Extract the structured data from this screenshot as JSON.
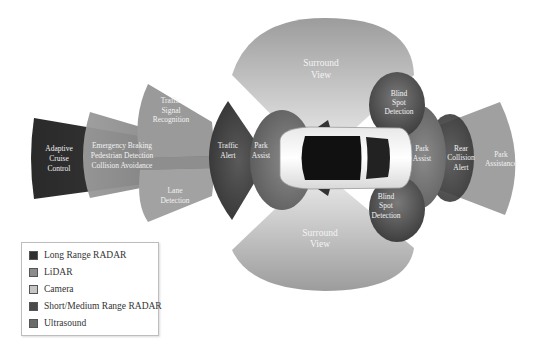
{
  "colors": {
    "long_range_radar": "#2f2f2f",
    "lidar": "#8c8c8c",
    "camera": "#b4b4b4",
    "short_medium_range_radar": "#4d4d4d",
    "ultrasound": "#6e6e6e"
  },
  "zones": {
    "adaptive_cruise_control": {
      "lines": [
        "Adaptive",
        "Cruise",
        "Control"
      ],
      "sensor": "Long Range RADAR"
    },
    "emergency_braking": {
      "lines": [
        "Emergency Braking",
        "Pedestrian Detection",
        "Collision Avoidance"
      ],
      "sensor": "LiDAR"
    },
    "traffic_signal_recognition": {
      "lines": [
        "Traffic",
        "Signal",
        "Recognition"
      ],
      "sensor": "Camera"
    },
    "lane_detection": {
      "lines": [
        "Lane",
        "Detection"
      ],
      "sensor": "Camera"
    },
    "traffic_alert": {
      "lines": [
        "Traffic",
        "Alert"
      ],
      "sensor": "Short/Medium Range RADAR"
    },
    "park_assist_front": {
      "lines": [
        "Park",
        "Assist"
      ],
      "sensor": "Ultrasound"
    },
    "surround_view_top": {
      "lines": [
        "Surround",
        "View"
      ],
      "sensor": "Camera"
    },
    "surround_view_bottom": {
      "lines": [
        "Surround",
        "View"
      ],
      "sensor": "Camera"
    },
    "blind_spot_top": {
      "lines": [
        "Blind",
        "Spot",
        "Detection"
      ],
      "sensor": "Short/Medium Range RADAR"
    },
    "blind_spot_bottom": {
      "lines": [
        "Blind",
        "Spot",
        "Detection"
      ],
      "sensor": "Short/Medium Range RADAR"
    },
    "park_assist_rear": {
      "lines": [
        "Park",
        "Assist"
      ],
      "sensor": "Ultrasound"
    },
    "rear_collision_alert": {
      "lines": [
        "Rear",
        "Collision",
        "Alert"
      ],
      "sensor": "Short/Medium Range RADAR"
    },
    "park_assistance": {
      "lines": [
        "Park",
        "Assistance"
      ],
      "sensor": "Camera"
    }
  },
  "legend": {
    "items": [
      {
        "label": "Long Range RADAR",
        "color": "#2f2f2f"
      },
      {
        "label": "LiDAR",
        "color": "#8c8c8c"
      },
      {
        "label": "Camera",
        "color": "#c6c6c6"
      },
      {
        "label": "Short/Medium Range RADAR",
        "color": "#4a4a4a"
      },
      {
        "label": "Ultrasound",
        "color": "#6b6b6b"
      }
    ]
  }
}
